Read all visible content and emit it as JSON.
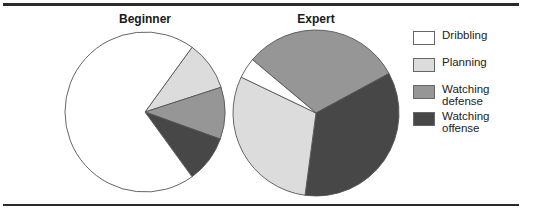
{
  "chart_data": [
    {
      "type": "pie",
      "title": "Beginner",
      "categories": [
        "Dribbling",
        "Planning",
        "Watching defense",
        "Watching offense"
      ],
      "values": [
        70,
        10,
        10.5,
        9.5
      ],
      "unit": "percent (estimated)"
    },
    {
      "type": "pie",
      "title": "Expert",
      "categories": [
        "Dribbling",
        "Planning",
        "Watching defense",
        "Watching offense"
      ],
      "values": [
        4,
        30,
        31,
        35
      ],
      "unit": "percent (estimated)"
    }
  ],
  "legend": {
    "placement": "right",
    "items": [
      {
        "label": "Dribbling",
        "color": "#ffffff"
      },
      {
        "label": "Planning",
        "color": "#dcdcdc"
      },
      {
        "label": "Watching\ndefense",
        "color": "#969696"
      },
      {
        "label": "Watching\noffense",
        "color": "#474747"
      }
    ]
  },
  "colors": {
    "Dribbling": "#ffffff",
    "Planning": "#dcdcdc",
    "Watching defense": "#969696",
    "Watching offense": "#474747",
    "outline": "#555555"
  }
}
